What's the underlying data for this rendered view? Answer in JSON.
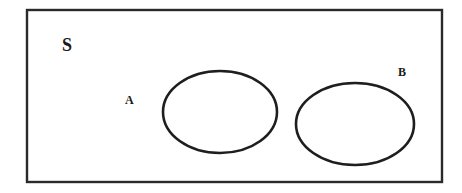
{
  "diagram": {
    "type": "venn",
    "universe": {
      "label": "S",
      "rect": {
        "x": 27,
        "y": 10,
        "width": 415,
        "height": 172
      },
      "stroke": "#2a2a2a",
      "label_pos": {
        "x": 62,
        "y": 51,
        "size": 18
      }
    },
    "sets": [
      {
        "name": "A",
        "label": "A",
        "cx": 220,
        "cy": 112,
        "rx": 57,
        "ry": 41,
        "label_pos": {
          "x": 125,
          "y": 104,
          "size": 12
        }
      },
      {
        "name": "B",
        "label": "B",
        "cx": 355,
        "cy": 124,
        "rx": 59,
        "ry": 41,
        "label_pos": {
          "x": 398,
          "y": 76,
          "size": 12
        }
      }
    ],
    "relationship": "disjoint",
    "stroke_color": "#1e1e1e",
    "background": "#ffffff"
  }
}
